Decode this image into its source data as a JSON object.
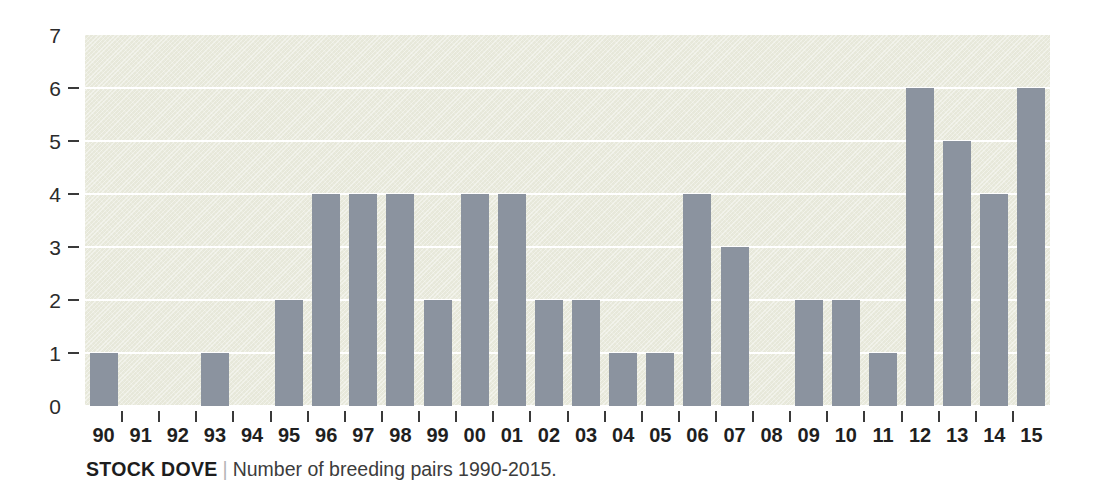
{
  "chart_data": {
    "type": "bar",
    "title": "STOCK DOVE",
    "subtitle": "Number of breeding pairs 1990-2015.",
    "separator": "|",
    "xlabel": "",
    "ylabel": "",
    "ylim": [
      0,
      7
    ],
    "grid": true,
    "legend": "none",
    "categories": [
      "90",
      "91",
      "92",
      "93",
      "94",
      "95",
      "96",
      "97",
      "98",
      "99",
      "00",
      "01",
      "02",
      "03",
      "04",
      "05",
      "06",
      "07",
      "08",
      "09",
      "10",
      "11",
      "12",
      "13",
      "14",
      "15"
    ],
    "full_years": [
      1990,
      1991,
      1992,
      1993,
      1994,
      1995,
      1996,
      1997,
      1998,
      1999,
      2000,
      2001,
      2002,
      2003,
      2004,
      2005,
      2006,
      2007,
      2008,
      2009,
      2010,
      2011,
      2012,
      2013,
      2014,
      2015
    ],
    "values": [
      1,
      0,
      0,
      1,
      0,
      2,
      4,
      4,
      4,
      2,
      4,
      4,
      2,
      2,
      1,
      1,
      4,
      3,
      0,
      2,
      2,
      1,
      6,
      5,
      4,
      6
    ],
    "y_ticks": [
      7,
      6,
      5,
      4,
      3,
      2,
      1,
      0
    ],
    "y_tick_labels": [
      "7",
      "6",
      "5",
      "4",
      "3",
      "2",
      "1",
      "0"
    ],
    "y_ticks_with_dash": [
      6,
      5,
      4,
      3,
      2,
      1
    ],
    "colors": {
      "bar": "#8b939f",
      "plot_background": "#e7e8da",
      "gridline": "#ffffff",
      "axis_text": "#1f1f1f",
      "caption_title": "#1d1d1d",
      "caption_subtitle": "#3c3c3c",
      "caption_separator": "#b5b5b5",
      "page_background": "#ffffff"
    }
  }
}
